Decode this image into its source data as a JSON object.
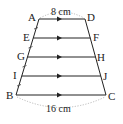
{
  "figure": {
    "type": "trapezoid",
    "vertices": {
      "A": "A",
      "B": "B",
      "C": "C",
      "D": "D"
    },
    "side_points": {
      "left": [
        "E",
        "G",
        "I"
      ],
      "right": [
        "F",
        "H",
        "J"
      ]
    },
    "parallel_segments": [
      "AD",
      "EF",
      "GH",
      "IJ",
      "BC"
    ],
    "dimensions": {
      "top": "8 cm",
      "bottom": "16 cm"
    },
    "equal_divisions_on_AB": 4,
    "colors": {
      "line": "#222222",
      "dotted": "#999999"
    }
  }
}
